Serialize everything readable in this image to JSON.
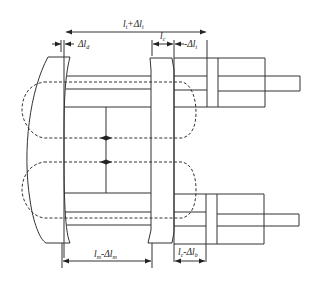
{
  "diagram": {
    "colors": {
      "stroke": "#333333",
      "background": "#ffffff",
      "text": "#222222"
    },
    "labels": {
      "top_total": {
        "main": "l",
        "sub": "t",
        "plus": "+Δl",
        "sub2": "t"
      },
      "left_delta": {
        "main": "Δl",
        "sub": "d"
      },
      "mid_gap": {
        "main": "l",
        "sub": "c"
      },
      "right_delta": {
        "main": "-Δl",
        "sub": "t"
      },
      "bottom_left": {
        "main": "l",
        "sub": "m",
        "minus": "-Δl",
        "sub2": "m"
      },
      "bottom_right": {
        "main": "l",
        "sub": "c",
        "minus": "-Δl",
        "sub2": "b"
      }
    }
  }
}
